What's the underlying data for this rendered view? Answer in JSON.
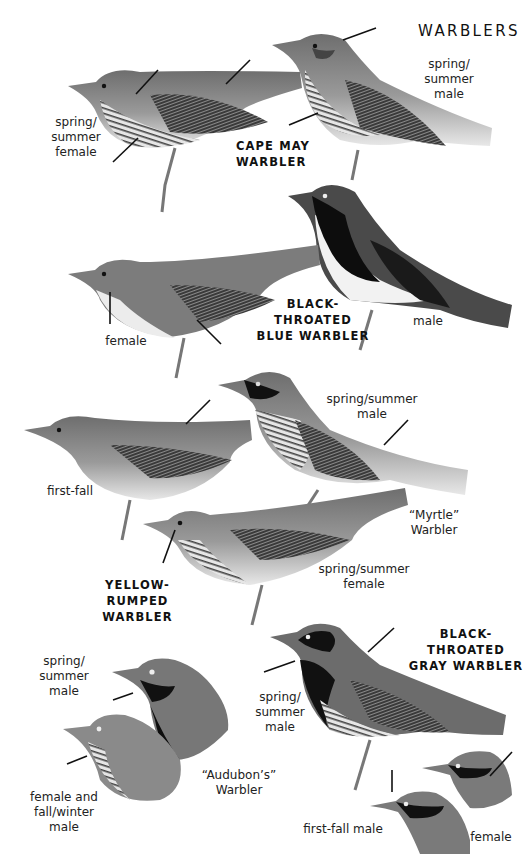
{
  "page": {
    "title": "WARBLERS",
    "background": "#ffffff"
  },
  "species": [
    {
      "name_line1": "CAPE MAY",
      "name_line2": "WARBLER",
      "plumages": [
        {
          "label_lines": [
            "spring/",
            "summer",
            "male"
          ]
        },
        {
          "label_lines": [
            "spring/",
            "summer",
            "female"
          ]
        }
      ]
    },
    {
      "name_line1": "BLACK-",
      "name_line2": "THROATED",
      "name_line3": "BLUE WARBLER",
      "plumages": [
        {
          "label_lines": [
            "male"
          ]
        },
        {
          "label_lines": [
            "female"
          ]
        }
      ]
    },
    {
      "name_line1": "YELLOW-RUMPED",
      "name_line2": "WARBLER",
      "plumages": [
        {
          "label_lines": [
            "spring/summer",
            "male"
          ]
        },
        {
          "label_lines": [
            "first-fall"
          ]
        },
        {
          "label_lines": [
            "spring/summer",
            "female"
          ]
        },
        {
          "label_lines": [
            "spring/",
            "summer male"
          ]
        },
        {
          "label_lines": [
            "female and",
            "fall/winter",
            "male"
          ]
        }
      ],
      "subspecies": [
        {
          "label_lines": [
            "“Myrtle”",
            "Warbler"
          ]
        },
        {
          "label_lines": [
            "“Audubon’s”",
            "Warbler"
          ]
        }
      ]
    },
    {
      "name_line1": "BLACK-",
      "name_line2": "THROATED",
      "name_line3": "GRAY WARBLER",
      "plumages": [
        {
          "label_lines": [
            "spring/",
            "summer",
            "male"
          ]
        },
        {
          "label_lines": [
            "first-fall male"
          ]
        },
        {
          "label_lines": [
            "female"
          ]
        }
      ]
    }
  ]
}
